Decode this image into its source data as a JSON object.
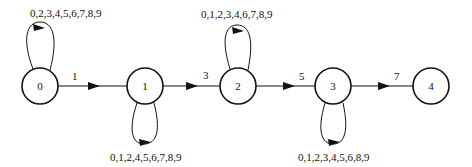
{
  "diagram": {
    "type": "state-transition",
    "nodes": [
      {
        "id": "0",
        "label": "0",
        "cx": 40,
        "cy": 86
      },
      {
        "id": "1",
        "label": "1",
        "cx": 145,
        "cy": 86
      },
      {
        "id": "2",
        "label": "2",
        "cx": 238,
        "cy": 86
      },
      {
        "id": "3",
        "label": "3",
        "cx": 333,
        "cy": 86
      },
      {
        "id": "4",
        "label": "4",
        "cx": 431,
        "cy": 86
      }
    ],
    "edges": [
      {
        "from": "0",
        "to": "1",
        "label": "1"
      },
      {
        "from": "1",
        "to": "2",
        "label": "3"
      },
      {
        "from": "2",
        "to": "3",
        "label": "5"
      },
      {
        "from": "3",
        "to": "4",
        "label": "7"
      }
    ],
    "self_loops": [
      {
        "node": "0",
        "position": "top",
        "label": "0,2,3,4,5,6,7,8,9"
      },
      {
        "node": "1",
        "position": "bottom",
        "label": "0,1,2,4,5,6,7,8,9"
      },
      {
        "node": "2",
        "position": "top",
        "label": "0,1,2,3,4,6,7,8,9"
      },
      {
        "node": "3",
        "position": "bottom",
        "label": "0,1,2,3,4,5,6,8,9"
      }
    ]
  }
}
